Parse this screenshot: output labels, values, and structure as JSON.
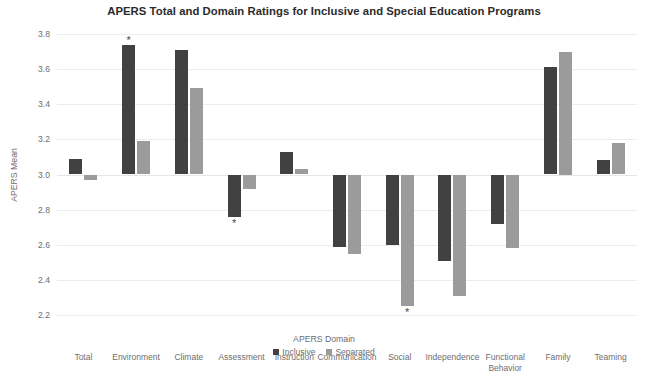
{
  "chart_data": {
    "type": "bar",
    "title": "APERS Total and Domain Ratings for Inclusive and Special Education Programs",
    "xlabel": "APERS Domain",
    "ylabel": "APERS Mean",
    "ylim": [
      2.2,
      3.8
    ],
    "ytick_step": 0.2,
    "yticks": [
      "3.8",
      "3.6",
      "3.4",
      "3.2",
      "3.0",
      "2.8",
      "2.6",
      "2.4",
      "2.2"
    ],
    "grid": true,
    "baseline": 3.0,
    "legend_position": "bottom-center",
    "categories": [
      "Total",
      "Environment",
      "Climate",
      "Assessment",
      "Instruction",
      "Communication",
      "Social",
      "Independence",
      "Functional Behavior",
      "Family",
      "Teaming"
    ],
    "series": [
      {
        "name": "Inclusive",
        "color": "#414141",
        "values": [
          3.09,
          3.74,
          3.71,
          2.76,
          3.13,
          2.59,
          2.6,
          2.51,
          2.72,
          3.61,
          3.08
        ]
      },
      {
        "name": "Separated",
        "color": "#9b9b9b",
        "values": [
          2.97,
          3.19,
          3.49,
          2.92,
          3.03,
          2.545,
          2.25,
          2.31,
          2.58,
          3.7,
          3.18
        ]
      }
    ],
    "annotations": [
      {
        "label": "*",
        "category": "Environment",
        "series": "Inclusive",
        "position": "above"
      },
      {
        "label": "*",
        "category": "Assessment",
        "series": "Inclusive",
        "position": "below"
      },
      {
        "label": "*",
        "category": "Social",
        "series": "Separated",
        "position": "below"
      }
    ]
  }
}
